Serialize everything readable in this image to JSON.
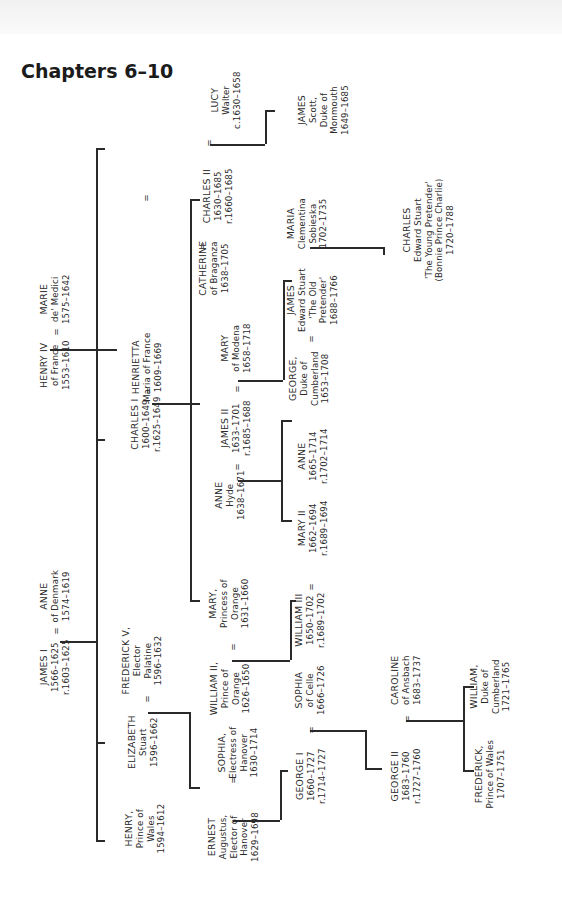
{
  "title": "Chapters 6–10",
  "people": {
    "lucy": [
      "LUCY",
      "Walter",
      "c.1630–1658"
    ],
    "james_monmouth": [
      "JAMES",
      "Scott,",
      "Duke of",
      "Monmouth",
      "1649–1685"
    ],
    "charles2": [
      "CHARLES II",
      "1630–1685",
      "r.1660–1685"
    ],
    "catherine": [
      "CATHERINE",
      "of Braganza",
      "1638–1705"
    ],
    "maria_clementina": [
      "MARIA",
      "Clementina",
      "Sobieska",
      "1702–1735"
    ],
    "james_old_pretender": [
      "JAMES",
      "Edward Stuart",
      "'The Old",
      "Pretender'",
      "1688–1766"
    ],
    "charles_young_pretender": [
      "CHARLES",
      "Edward Stuart",
      "'The Young Pretender'",
      "(Bonnie Prince Charlie)",
      "1720–1788"
    ],
    "marie_medici": [
      "MARIE",
      "de' Medici",
      "1575–1642"
    ],
    "henry4": [
      "HENRY IV",
      "of France",
      "1553–1610"
    ],
    "henrietta": [
      "HENRIETTA",
      "Maria of France",
      "1609–1669"
    ],
    "charles1": [
      "CHARLES I",
      "1600–1649",
      "r.1625–1649"
    ],
    "mary_modena": [
      "MARY",
      "of Modena",
      "1658–1718"
    ],
    "george_cumberland_1": [
      "GEORGE,",
      "Duke of",
      "Cumberland",
      "1653–1708"
    ],
    "james2": [
      "JAMES II",
      "1633–1701",
      "r.1685–1688"
    ],
    "anne_hyde": [
      "ANNE",
      "Hyde",
      "1638–1671"
    ],
    "anne_queen": [
      "ANNE",
      "1665–1714",
      "r.1702–1714"
    ],
    "mary2": [
      "MARY II",
      "1662–1694",
      "r.1689–1694"
    ],
    "anne_denmark": [
      "ANNE",
      "of Denmark",
      "1574–1619"
    ],
    "james1": [
      "JAMES I",
      "1566–1625",
      "r.1603–1625"
    ],
    "mary_orange": [
      "MARY,",
      "Princess of",
      "Orange",
      "1631–1660"
    ],
    "william3": [
      "WILLIAM III",
      "1650–1702",
      "r.1689–1702"
    ],
    "frederick5": [
      "FREDERICK V,",
      "Elector",
      "Palatine",
      "1596–1632"
    ],
    "william2": [
      "WILLIAM II,",
      "Prince of",
      "Orange",
      "1626–1650"
    ],
    "elizabeth": [
      "ELIZABETH",
      "Stuart",
      "1596–1662"
    ],
    "henry_wales": [
      "HENRY,",
      "Prince of",
      "Wales",
      "1594–1612"
    ],
    "sophia_hanover": [
      "SOPHIA,",
      "Electress of",
      "Hanover",
      "1630–1714"
    ],
    "ernest": [
      "ERNEST",
      "Augustus,",
      "Elector of",
      "Hanover",
      "1629–1698"
    ],
    "sophia_celle": [
      "SOPHIA",
      "of Celle",
      "1666–1726"
    ],
    "george1": [
      "GEORGE I",
      "1660–1727",
      "r.1714–1727"
    ],
    "caroline": [
      "CAROLINE",
      "of Ansbach",
      "1683–1737"
    ],
    "george2": [
      "GEORGE II",
      "1683–1760",
      "r.1727–1760"
    ],
    "william_cumberland": [
      "WILLIAM,",
      "Duke of",
      "Cumberland",
      "1721–1765"
    ],
    "frederick_wales": [
      "FREDERICK,",
      "Prince of Wales",
      "1707–1751"
    ]
  },
  "marriage_symbol": "="
}
